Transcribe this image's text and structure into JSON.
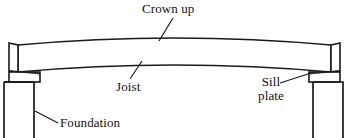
{
  "diagram": {
    "stroke_color": "#1a1a1a",
    "fill_color": "#ffffff",
    "background_color": "#ffffff",
    "labels": {
      "crown_up": "Crown up",
      "joist": "Joist",
      "sill_plate_line1": "Sill",
      "sill_plate_line2": "plate",
      "foundation": "Foundation"
    },
    "parts": [
      {
        "name": "joist",
        "description": "Long horizontal framing member crowned (curved) upward"
      },
      {
        "name": "sill-plate-left",
        "description": "Flat plate between left foundation wall and joist end"
      },
      {
        "name": "sill-plate-right",
        "description": "Flat plate between right foundation wall and joist end"
      },
      {
        "name": "foundation-wall-left",
        "description": "Left foundation wall in section"
      },
      {
        "name": "foundation-wall-right",
        "description": "Right foundation wall in section"
      }
    ],
    "leaders": [
      {
        "name": "crown-up-leader",
        "from": [
          172,
          18
        ],
        "to": [
          159,
          41
        ]
      },
      {
        "name": "joist-leader",
        "from": [
          130,
          78
        ],
        "to": [
          141,
          62
        ]
      },
      {
        "name": "sill-plate-leader",
        "from": [
          281,
          82
        ],
        "to": [
          312,
          73
        ]
      },
      {
        "name": "foundation-leader",
        "from": [
          57,
          122
        ],
        "to": [
          35,
          110
        ]
      }
    ],
    "geometry": {
      "joist_top_left": [
        18,
        45
      ],
      "joist_top_mid": [
        175,
        36
      ],
      "joist_top_right": [
        331,
        45
      ],
      "joist_bottom_left": [
        18,
        72
      ],
      "joist_bottom_mid": [
        175,
        63
      ],
      "joist_bottom_right": [
        331,
        72
      ],
      "left_end_x": 18,
      "right_end_x": 331,
      "sill_left": [
        14,
        72,
        38,
        10
      ],
      "sill_right": [
        310,
        72,
        38,
        10
      ],
      "foundation_left": [
        4,
        82,
        31,
        56
      ],
      "foundation_right": [
        313,
        82,
        31,
        56
      ]
    }
  }
}
